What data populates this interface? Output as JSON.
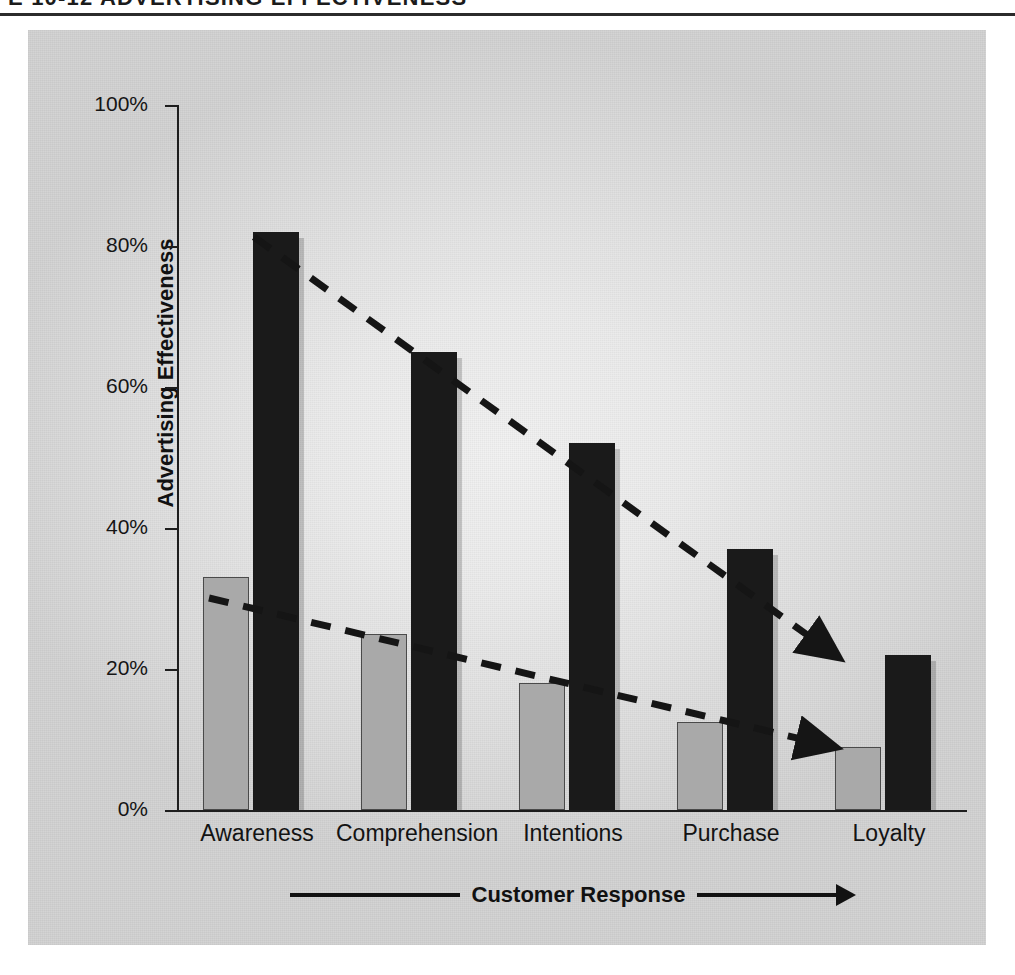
{
  "running_head": {
    "text": "E 10-12  ADVERTISING EFFECTIVENESS"
  },
  "chart_data": {
    "type": "bar",
    "title": "",
    "subtitle": "",
    "xlabel": "Customer Response",
    "ylabel": "Advertising Effectiveness",
    "categories": [
      "Awareness",
      "Comprehension",
      "Intentions",
      "Purchase",
      "Loyalty"
    ],
    "series": [
      {
        "name": "gray-series",
        "color": "#a9a9a9",
        "values": [
          33,
          25,
          18,
          12.5,
          9
        ]
      },
      {
        "name": "black-series",
        "color": "#1a1a1a",
        "values": [
          82,
          65,
          52,
          37,
          22
        ]
      }
    ],
    "ylim": [
      0,
      100
    ],
    "ytick_labels": [
      "100%",
      "80%",
      "60%",
      "40%",
      "20%",
      "0%"
    ],
    "ytick_values": [
      100,
      80,
      60,
      40,
      20,
      0
    ],
    "grid": false,
    "legend": "none",
    "annotations": [
      {
        "name": "upper-trend-arrow",
        "style": "dashed-arrow",
        "from_category": "Awareness",
        "from_value": 82,
        "to_category": "Loyalty",
        "to_value": 24
      },
      {
        "name": "lower-trend-arrow",
        "style": "dashed-arrow",
        "from_category": "Awareness",
        "from_value": 31,
        "to_category": "Loyalty",
        "to_value": 11
      }
    ],
    "xaxis_arrow": "right"
  },
  "colors": {
    "panel_background": "#e6e6e6",
    "ink": "#151515",
    "gray_bar": "#a9a9a9",
    "black_bar": "#1a1a1a"
  }
}
